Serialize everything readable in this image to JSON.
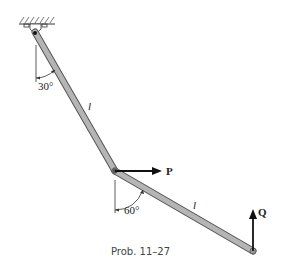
{
  "diagram": {
    "caption": "Prob. 11–27",
    "angles": {
      "upper": "30°",
      "lower": "60°"
    },
    "lengths": {
      "upper": "l",
      "lower": "l"
    },
    "forces": {
      "horizontal": "P",
      "vertical": "Q"
    },
    "colors": {
      "bar": "#b5b5b5",
      "bar_edge": "#555555",
      "line": "#111111"
    }
  }
}
